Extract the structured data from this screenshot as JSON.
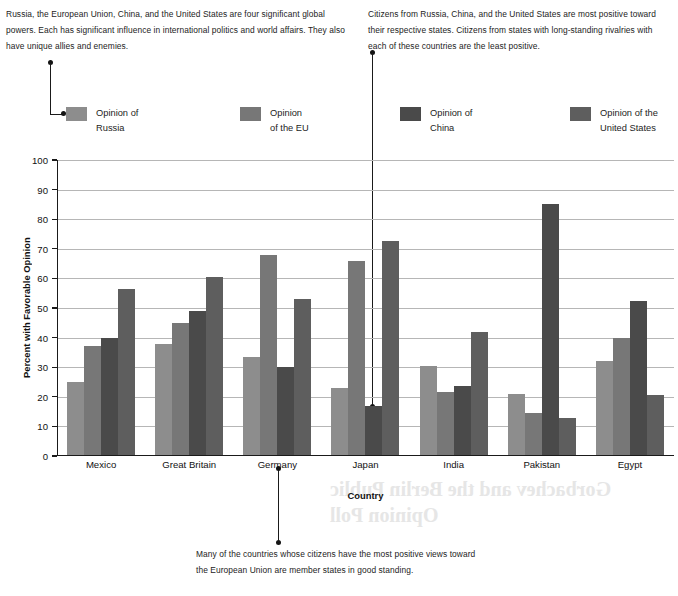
{
  "annotations": {
    "top_left": "Russia, the European Union, China, and the United States are four significant global powers. Each has significant influence in international politics and world affairs. They also have unique allies and enemies.",
    "top_right": "Citizens from Russia, China, and the United States are most positive toward their respective states. Citizens from states with long-standing rivalries with each of these countries are the least positive.",
    "bottom": "Many of the countries whose citizens have the most positive views toward the European Union are member states in good standing."
  },
  "showthrough": {
    "line1": "Gorbachev and the Berlin Public",
    "line2": "Opinion Poll"
  },
  "chart_data": {
    "type": "bar",
    "title": "",
    "xlabel": "Country",
    "ylabel": "Percent with Favorable Opinion",
    "ylim": [
      0,
      100
    ],
    "ytick_step": 10,
    "yticks": [
      100,
      90,
      80,
      70,
      60,
      50,
      40,
      30,
      20,
      10,
      0
    ],
    "grid": true,
    "legend_position": "above-plot",
    "categories": [
      "Mexico",
      "Great Britain",
      "Germany",
      "Japan",
      "India",
      "Pakistan",
      "Egypt"
    ],
    "series": [
      {
        "name": "Opinion of\nRussia",
        "color": "#8d8d8d",
        "values": [
          25,
          38,
          33.5,
          23,
          30.5,
          21,
          32
        ]
      },
      {
        "name": "Opinion\nof the EU",
        "color": "#777777",
        "values": [
          37,
          45,
          68,
          66,
          21.5,
          14.5,
          40
        ]
      },
      {
        "name": "Opinion of\nChina",
        "color": "#4a4a4a",
        "values": [
          40,
          49,
          30,
          17,
          23.5,
          85,
          52.5
        ]
      },
      {
        "name": "Opinion of the\nUnited States",
        "color": "#5e5e5e",
        "values": [
          56.5,
          60.5,
          53,
          72.5,
          42,
          13,
          20.5
        ]
      }
    ]
  }
}
